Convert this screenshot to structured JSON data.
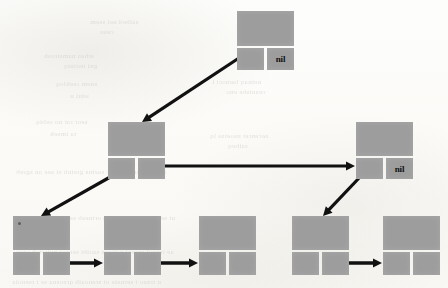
{
  "diagram": {
    "kind": "cons-cell-tree",
    "background_color": "#fcfcfa",
    "box_color": "#9d9d9d",
    "arrow_color": "#111111",
    "nil_label": "nil"
  },
  "nodes": [
    {
      "id": "root",
      "name": "root-node",
      "x": 237,
      "y": 11,
      "head": {
        "w": 57,
        "h": 35
      },
      "car": {
        "x": 0,
        "y": 37,
        "w": 27,
        "h": 22,
        "label": ""
      },
      "cdr": {
        "x": 30,
        "y": 37,
        "w": 27,
        "h": 22,
        "label": "nil"
      }
    },
    {
      "id": "mid-left",
      "name": "mid-left-node",
      "x": 108,
      "y": 122,
      "head": {
        "w": 57,
        "h": 34
      },
      "car": {
        "x": 0,
        "y": 36,
        "w": 27,
        "h": 21,
        "label": ""
      },
      "cdr": {
        "x": 30,
        "y": 36,
        "w": 27,
        "h": 21,
        "label": ""
      }
    },
    {
      "id": "mid-right",
      "name": "mid-right-node",
      "x": 356,
      "y": 122,
      "head": {
        "w": 57,
        "h": 34
      },
      "car": {
        "x": 0,
        "y": 36,
        "w": 27,
        "h": 21,
        "label": ""
      },
      "cdr": {
        "x": 30,
        "y": 36,
        "w": 27,
        "h": 21,
        "label": "nil"
      }
    },
    {
      "id": "leaf-1",
      "name": "leaf-node-1",
      "x": 13,
      "y": 216,
      "head": {
        "w": 57,
        "h": 34
      },
      "car": {
        "x": 0,
        "y": 36,
        "w": 27,
        "h": 23,
        "label": ""
      },
      "cdr": {
        "x": 30,
        "y": 36,
        "w": 27,
        "h": 23,
        "label": ""
      }
    },
    {
      "id": "leaf-2",
      "name": "leaf-node-2",
      "x": 104,
      "y": 216,
      "head": {
        "w": 57,
        "h": 34
      },
      "car": {
        "x": 0,
        "y": 36,
        "w": 27,
        "h": 23,
        "label": ""
      },
      "cdr": {
        "x": 30,
        "y": 36,
        "w": 27,
        "h": 23,
        "label": ""
      }
    },
    {
      "id": "leaf-3",
      "name": "leaf-node-3",
      "x": 199,
      "y": 216,
      "head": {
        "w": 57,
        "h": 34
      },
      "car": {
        "x": 0,
        "y": 36,
        "w": 27,
        "h": 23,
        "label": ""
      },
      "cdr": {
        "x": 30,
        "y": 36,
        "w": 27,
        "h": 23,
        "label": ""
      }
    },
    {
      "id": "leaf-4",
      "name": "leaf-node-4",
      "x": 292,
      "y": 216,
      "head": {
        "w": 57,
        "h": 34
      },
      "car": {
        "x": 0,
        "y": 36,
        "w": 27,
        "h": 23,
        "label": ""
      },
      "cdr": {
        "x": 30,
        "y": 36,
        "w": 27,
        "h": 23,
        "label": ""
      }
    },
    {
      "id": "leaf-5",
      "name": "leaf-node-5",
      "x": 383,
      "y": 216,
      "head": {
        "w": 57,
        "h": 34
      },
      "car": {
        "x": 0,
        "y": 36,
        "w": 27,
        "h": 23,
        "label": ""
      },
      "cdr": {
        "x": 30,
        "y": 36,
        "w": 27,
        "h": 23,
        "label": ""
      }
    }
  ],
  "arrows": [
    {
      "name": "arrow-root-to-mid-left",
      "from": "root.car",
      "to": "mid-left.head",
      "x1": 239,
      "y1": 58,
      "x2": 142,
      "y2": 122,
      "width": 3.2
    },
    {
      "name": "arrow-mid-left-to-mid-right",
      "from": "mid-left.cdr",
      "to": "mid-right.car",
      "x1": 141,
      "y1": 166,
      "x2": 355,
      "y2": 166,
      "width": 3.2
    },
    {
      "name": "arrow-mid-left-to-leaf-1",
      "from": "mid-left.car",
      "to": "leaf-1.head",
      "x1": 112,
      "y1": 176,
      "x2": 41,
      "y2": 216,
      "width": 3.2
    },
    {
      "name": "arrow-mid-right-to-leaf-4",
      "from": "mid-right.car",
      "to": "leaf-4.head",
      "x1": 360,
      "y1": 177,
      "x2": 323,
      "y2": 216,
      "width": 3.2
    },
    {
      "name": "arrow-leaf-1-to-leaf-2",
      "from": "leaf-1.cdr",
      "to": "leaf-2.car",
      "x1": 53,
      "y1": 263,
      "x2": 103,
      "y2": 263,
      "width": 3.6
    },
    {
      "name": "arrow-leaf-2-to-leaf-3",
      "from": "leaf-2.cdr",
      "to": "leaf-3.car",
      "x1": 142,
      "y1": 263,
      "x2": 198,
      "y2": 263,
      "width": 3.6
    },
    {
      "name": "arrow-leaf-4-to-leaf-5",
      "from": "leaf-4.cdr",
      "to": "leaf-5.car",
      "x1": 330,
      "y1": 263,
      "x2": 382,
      "y2": 263,
      "width": 3.6
    }
  ],
  "marks": [
    {
      "name": "ink-speck-leaf-1",
      "x": 18,
      "y": 222
    }
  ],
  "bleed_text": [
    {
      "id": "b1",
      "x": 90,
      "y": 18,
      "size": 7,
      "text": "saibed nei ssem"
    },
    {
      "id": "b2",
      "x": 100,
      "y": 28,
      "size": 7,
      "text": "ceus"
    },
    {
      "id": "b3",
      "x": 44,
      "y": 52,
      "size": 7,
      "text": "srhea  namsirosh"
    },
    {
      "id": "b4",
      "x": 64,
      "y": 62,
      "size": 7,
      "text": "gni  teoiniq"
    },
    {
      "id": "b5",
      "x": 56,
      "y": 80,
      "size": 7,
      "text": "snem reehloq"
    },
    {
      "id": "b6",
      "x": 70,
      "y": 92,
      "size": 7,
      "text": "sdni u"
    },
    {
      "id": "b7",
      "x": 36,
      "y": 118,
      "size": 7,
      "text": "seor rat no osbiq"
    },
    {
      "id": "b8",
      "x": 50,
      "y": 130,
      "size": 7,
      "text": "ta imseh"
    },
    {
      "id": "b9",
      "x": 212,
      "y": 78,
      "size": 7,
      "text": "neinaq  laenoct  i"
    },
    {
      "id": "b10",
      "x": 226,
      "y": 88,
      "size": 7,
      "text": "ceanisbe  eno"
    },
    {
      "id": "b11",
      "x": 210,
      "y": 132,
      "size": 7,
      "text": "aecenret  nsoetas lq"
    },
    {
      "id": "b12",
      "x": 228,
      "y": 142,
      "size": 7,
      "text": "saibeq"
    },
    {
      "id": "b13",
      "x": 16,
      "y": 168,
      "size": 7,
      "text": "a  rceih   l  sreieton  or   saeins  gretnb  si  aee an sgreb"
    },
    {
      "id": "b14",
      "x": 14,
      "y": 214,
      "size": 7,
      "text": "ut  se rnteiae  sa onreesq  ortneab  seer  oa treb  rsnei ae"
    },
    {
      "id": "b15",
      "x": 16,
      "y": 248,
      "size": 7,
      "text": "ae  tnseoi  snreot  neiraes  saoibt  sereoa  nuiretab  saeo"
    },
    {
      "id": "b16",
      "x": 12,
      "y": 278,
      "size": 7,
      "text": "n  traeo  t  sernaie  ot  srenoaib  qreosna  se  t  rsenoia"
    }
  ]
}
